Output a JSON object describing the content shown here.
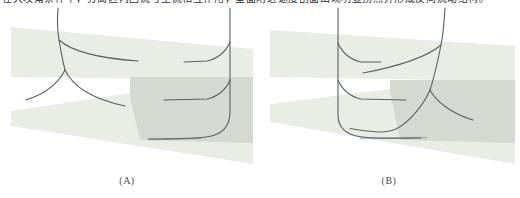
{
  "figure": {
    "top_text_clipped": "在大攻角条件下，分离区内回流与主流相互作用，壁面附近速度剖面出现明显拐点并形成反向流动结构。"
  },
  "panels": {
    "a": {
      "label": "(A)"
    },
    "b": {
      "label": "(B)"
    }
  },
  "colors": {
    "background": "#ffffff",
    "band_light": "#eaece6",
    "band_overlap": "#d6d9d2",
    "streamline": "#5a6065",
    "tail_thick": "#a7ada6",
    "label_text": "#4c4c4c",
    "top_text": "#2e2e2e"
  }
}
